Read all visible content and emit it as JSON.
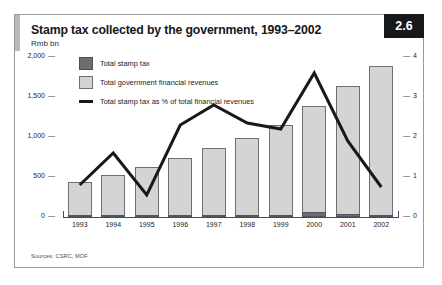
{
  "figure": {
    "title": "Stamp tax collected by the government, 1993–2002",
    "unit_label": "Rmb bn",
    "badge": "2.6",
    "source": "Sources: CSRC, MOF"
  },
  "legend": {
    "items": [
      {
        "key": "stamp",
        "label": "Total stamp tax",
        "marker": "square-dark",
        "color": "#6d6e72"
      },
      {
        "key": "revenues",
        "label": "Total government financial revenues",
        "marker": "square-light",
        "color": "#d4d4d4"
      },
      {
        "key": "share",
        "label": "Total stamp tax as % of total financial revenues",
        "marker": "line-dark",
        "color": "#17181c"
      }
    ]
  },
  "chart_data": {
    "type": "bar",
    "title": "Stamp tax collected by the government, 1993–2002",
    "subtitle": "Rmb bn",
    "xlabel": "",
    "ylabel": "Rmb bn",
    "categories": [
      "1993",
      "1994",
      "1995",
      "1996",
      "1997",
      "1998",
      "1999",
      "2000",
      "2001",
      "2002"
    ],
    "ylim": [
      0,
      2000
    ],
    "y_ticks": [
      "0",
      "500",
      "1,000",
      "1,500",
      "2,000"
    ],
    "y2lim": [
      0,
      4
    ],
    "y2_ticks": [
      "0",
      "1",
      "2",
      "3",
      "4"
    ],
    "y2label": "%",
    "grid": false,
    "legend_position": "top-left",
    "series": [
      {
        "name": "Total government financial revenues",
        "type": "bar",
        "axis": "left",
        "color": "#d4d4d4",
        "values": [
          435,
          520,
          625,
          740,
          865,
          988,
          1145,
          1390,
          1640,
          1890
        ]
      },
      {
        "name": "Total stamp tax",
        "type": "bar",
        "axis": "left",
        "color": "#6d6e72",
        "values": [
          10,
          18,
          10,
          20,
          29,
          27,
          28,
          60,
          32,
          18
        ]
      },
      {
        "name": "Total stamp tax as % of total financial revenues",
        "type": "line",
        "axis": "right",
        "color": "#17181c",
        "values": [
          0.8,
          1.6,
          0.55,
          2.3,
          2.8,
          2.35,
          2.2,
          3.6,
          1.9,
          0.75
        ]
      }
    ]
  }
}
